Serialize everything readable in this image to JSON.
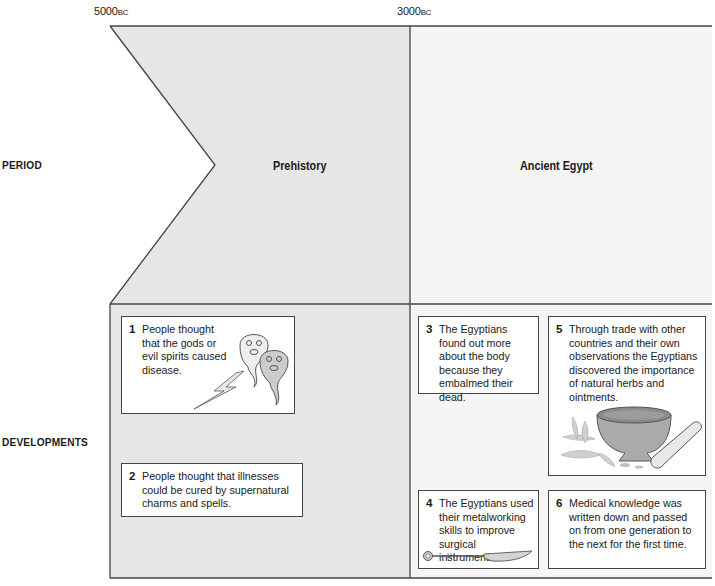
{
  "timeline": {
    "start_date": "5000",
    "start_era": "BC",
    "mid_date": "3000",
    "mid_era": "BC"
  },
  "rows": {
    "period_label": "PERIOD",
    "developments_label": "DEVELOPMENTS"
  },
  "periods": [
    {
      "name": "Prehistory",
      "fill": "#e6e6e6"
    },
    {
      "name": "Ancient Egypt",
      "fill": "#f4f4f4"
    }
  ],
  "developments": [
    {
      "num": "1",
      "text": "People thought that the gods or evil spirits caused disease.",
      "illustration": "ghosts-with-lightning"
    },
    {
      "num": "2",
      "text": "People thought that illnesses could be cured by supernatural charms and spells."
    },
    {
      "num": "3",
      "text": "The Egyptians found out more about the body because they embalmed their dead."
    },
    {
      "num": "4",
      "text": "The Egyptians used their metalworking skills to improve surgical instruments.",
      "illustration": "surgical-knife"
    },
    {
      "num": "5",
      "text": "Through trade with other countries and their own observations the Egyptians discovered the importance of natural herbs and ointments.",
      "illustration": "mortar-pestle-herbs"
    },
    {
      "num": "6",
      "text": "Medical knowledge was written down and passed on from one generation to the next for the first time."
    }
  ],
  "colors": {
    "line": "#444444",
    "prehistory_fill": "#e6e6e6",
    "egypt_fill": "#f4f4f4"
  }
}
